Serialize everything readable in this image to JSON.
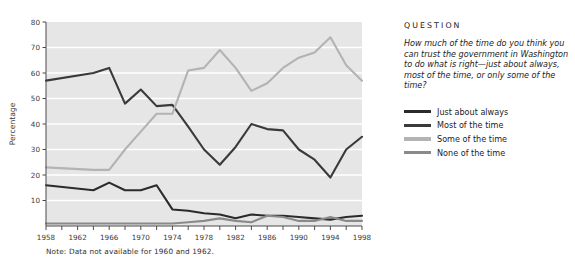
{
  "chart_data": {
    "type": "line",
    "title": "",
    "xlabel": "",
    "ylabel": "Percentage",
    "xlim": [
      1958,
      1998
    ],
    "ylim": [
      0,
      80
    ],
    "yticks": [
      10,
      20,
      30,
      40,
      50,
      60,
      70,
      80
    ],
    "xticks": [
      1958,
      1960,
      1962,
      1964,
      1966,
      1968,
      1970,
      1972,
      1974,
      1976,
      1978,
      1980,
      1982,
      1984,
      1986,
      1988,
      1990,
      1992,
      1994,
      1996,
      1998
    ],
    "xtick_labels": [
      1958,
      1962,
      1966,
      1970,
      1974,
      1978,
      1982,
      1986,
      1990,
      1994,
      1998
    ],
    "grid": "horizontal-white",
    "plot_background": "#e6e6e6",
    "legend_position": "right",
    "note": "Note:  Data not available for 1960 and 1962.",
    "x": [
      1958,
      1964,
      1966,
      1968,
      1970,
      1972,
      1974,
      1976,
      1978,
      1980,
      1982,
      1984,
      1986,
      1988,
      1990,
      1992,
      1994,
      1996,
      1998
    ],
    "series": [
      {
        "name": "Just about always",
        "color": "#2b2b2b",
        "values": [
          16,
          14,
          17,
          14,
          14,
          16,
          6.5,
          6,
          5,
          4.5,
          3,
          4.5,
          4,
          4,
          3.5,
          3,
          2.5,
          3.5,
          4
        ]
      },
      {
        "name": "Most of the time",
        "color": "#3a3a3a",
        "values": [
          57,
          60,
          62,
          48,
          53.5,
          47,
          47.5,
          39,
          30,
          24,
          31,
          40,
          38,
          37.5,
          30,
          26,
          19,
          30,
          35
        ]
      },
      {
        "name": "Some of the time",
        "color": "#b3b3b3",
        "values": [
          23,
          22,
          22,
          30,
          37,
          44,
          44,
          61,
          62,
          69,
          62,
          53,
          56,
          62,
          66,
          68,
          74,
          63,
          57
        ]
      },
      {
        "name": "None of the time",
        "color": "#8a8a8a",
        "values": [
          1,
          1,
          1,
          1,
          1,
          1,
          1,
          1.5,
          2,
          3,
          2,
          1.5,
          4,
          3.5,
          2,
          2,
          3.5,
          2,
          2
        ]
      }
    ]
  },
  "axes": {
    "ylabel": "Percentage"
  },
  "panel": {
    "question_heading": "QUESTION",
    "question_text": "How much of the time do you think you can trust the government in Washington to do what is right—just about always, most of the time, or only some of the time?",
    "legend": [
      {
        "label": "Just about always",
        "color": "#2b2b2b"
      },
      {
        "label": "Most of the time",
        "color": "#3a3a3a"
      },
      {
        "label": "Some of the time",
        "color": "#b3b3b3"
      },
      {
        "label": "None of the time",
        "color": "#8a8a8a"
      }
    ]
  },
  "note": {
    "text": "Note:  Data not available for 1960 and 1962."
  }
}
